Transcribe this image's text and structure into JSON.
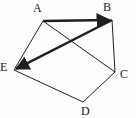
{
  "figure": {
    "kind": "graph-diagram",
    "background_color": "#fdfdfd",
    "ink_color": "#1f1f1f",
    "width": 136,
    "height": 118
  },
  "vertices": [
    {
      "id": "A",
      "label": "A",
      "x": 43,
      "y": 21,
      "label_x": 33,
      "label_y": 2
    },
    {
      "id": "B",
      "label": "B",
      "x": 112,
      "y": 20,
      "label_x": 103,
      "label_y": 1
    },
    {
      "id": "C",
      "label": "C",
      "x": 115,
      "y": 72,
      "label_x": 120,
      "label_y": 68
    },
    {
      "id": "D",
      "label": "D",
      "x": 83,
      "y": 102,
      "label_x": 81,
      "label_y": 105
    },
    {
      "id": "E",
      "label": "E",
      "x": 14,
      "y": 70,
      "label_x": 0,
      "label_y": 61
    }
  ],
  "edges": [
    {
      "id": "A-B",
      "from": "A",
      "to": "B",
      "style": "thick",
      "arrow": "to",
      "width": 2.4
    },
    {
      "id": "A-E",
      "from": "A",
      "to": "E",
      "style": "thin",
      "arrow": "none",
      "width": 1
    },
    {
      "id": "A-C",
      "from": "A",
      "to": "C",
      "style": "thin",
      "arrow": "none",
      "width": 1
    },
    {
      "id": "B-E",
      "from": "B",
      "to": "E",
      "style": "thick",
      "arrow": "to",
      "width": 2.4
    },
    {
      "id": "B-C",
      "from": "B",
      "to": "C",
      "style": "thin",
      "arrow": "none",
      "width": 1
    },
    {
      "id": "C-D",
      "from": "C",
      "to": "D",
      "style": "thin",
      "arrow": "none",
      "width": 1
    },
    {
      "id": "D-E",
      "from": "D",
      "to": "E",
      "style": "thin",
      "arrow": "none",
      "width": 1
    }
  ]
}
